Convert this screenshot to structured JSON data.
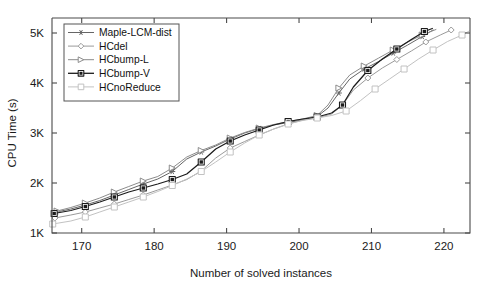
{
  "chart_data": {
    "type": "line",
    "title": "",
    "xlabel": "Number of solved instances",
    "ylabel": "CPU Time (s)",
    "xlim": [
      165.9,
      223.6
    ],
    "ylim": [
      1000,
      5300
    ],
    "xticks": [
      170,
      180,
      190,
      200,
      210,
      220
    ],
    "xticklabels": [
      "170",
      "180",
      "190",
      "200",
      "210",
      "220"
    ],
    "yticks": [
      1000,
      2000,
      3000,
      4000,
      5000
    ],
    "yticklabels": [
      "1K",
      "2K",
      "3K",
      "4K",
      "5K"
    ],
    "grid": false,
    "legend_position": "upper left",
    "series": [
      {
        "name": "Maple-LCM-dist",
        "color": "#666666",
        "marker": "star",
        "x": [
          166.5,
          168.5,
          170.5,
          172.5,
          174.5,
          176.5,
          178.5,
          180.5,
          182.5,
          184.5,
          186.5,
          188.5,
          190.5,
          192.5,
          194.5,
          196.5,
          198.5,
          200.5,
          202.5,
          204.0,
          205.5,
          207.0,
          209.0,
          211.0,
          213.0,
          215.0,
          217.0,
          218.5
        ],
        "y": [
          1420,
          1480,
          1560,
          1650,
          1760,
          1870,
          1980,
          2080,
          2230,
          2480,
          2620,
          2740,
          2880,
          3000,
          3090,
          3160,
          3210,
          3260,
          3330,
          3500,
          3800,
          4080,
          4280,
          4430,
          4600,
          4760,
          4930,
          5060
        ]
      },
      {
        "name": "HCdel",
        "color": "#9a9a9a",
        "marker": "diamond",
        "x": [
          166.3,
          168.5,
          170.5,
          172.5,
          174.5,
          176.5,
          178.5,
          180.5,
          182.5,
          184.5,
          186.5,
          188.5,
          190.5,
          192.5,
          194.5,
          196.5,
          198.5,
          200.5,
          202.5,
          204.5,
          206.0,
          207.5,
          209.5,
          211.5,
          213.5,
          215.5,
          217.5,
          219.5,
          221.0
        ],
        "y": [
          1300,
          1360,
          1420,
          1500,
          1580,
          1670,
          1760,
          1860,
          1960,
          2070,
          2240,
          2500,
          2700,
          2830,
          2960,
          3080,
          3180,
          3260,
          3300,
          3380,
          3560,
          3860,
          4100,
          4300,
          4470,
          4640,
          4820,
          4960,
          5060
        ]
      },
      {
        "name": "HCbump-L",
        "color": "#8c8c8c",
        "marker": "triangle-right",
        "x": [
          166.6,
          168.5,
          170.5,
          172.5,
          174.5,
          176.5,
          178.5,
          180.5,
          182.5,
          184.5,
          186.5,
          188.5,
          190.5,
          192.5,
          194.5,
          196.5,
          198.5,
          200.5,
          202.5,
          204.0,
          205.5,
          207.0,
          209.0,
          211.0,
          213.0,
          215.0,
          217.0,
          218.9
        ],
        "y": [
          1440,
          1510,
          1600,
          1700,
          1820,
          1930,
          2040,
          2130,
          2300,
          2520,
          2650,
          2760,
          2900,
          3010,
          3100,
          3170,
          3230,
          3280,
          3350,
          3560,
          3900,
          4160,
          4340,
          4500,
          4660,
          4820,
          4960,
          5070
        ]
      },
      {
        "name": "HCbump-V",
        "color": "#1b1b1b",
        "marker": "square-filled",
        "x": [
          166.2,
          168.5,
          170.5,
          172.5,
          174.5,
          176.5,
          178.5,
          180.5,
          182.5,
          184.5,
          186.5,
          188.5,
          190.5,
          192.5,
          194.5,
          196.5,
          198.5,
          200.5,
          202.5,
          204.5,
          206.0,
          207.5,
          209.5,
          211.5,
          213.5,
          215.5,
          217.3,
          218.4
        ],
        "y": [
          1390,
          1450,
          1530,
          1620,
          1720,
          1820,
          1900,
          1980,
          2070,
          2180,
          2420,
          2680,
          2840,
          2960,
          3060,
          3160,
          3230,
          3280,
          3320,
          3400,
          3560,
          3920,
          4250,
          4480,
          4680,
          4870,
          5030,
          5090
        ]
      },
      {
        "name": "HCnoReduce",
        "color": "#c2c2c2",
        "marker": "square-open",
        "x": [
          166.0,
          168.5,
          170.5,
          172.5,
          174.5,
          176.5,
          178.5,
          180.5,
          182.5,
          184.5,
          186.5,
          188.5,
          190.5,
          192.5,
          194.5,
          196.5,
          198.5,
          200.5,
          202.5,
          204.5,
          206.5,
          208.5,
          210.5,
          212.5,
          214.5,
          216.5,
          218.5,
          220.5,
          222.5,
          223.5
        ],
        "y": [
          1180,
          1240,
          1320,
          1420,
          1520,
          1620,
          1720,
          1830,
          1950,
          2080,
          2230,
          2420,
          2620,
          2800,
          2960,
          3080,
          3180,
          3250,
          3300,
          3350,
          3440,
          3650,
          3880,
          4080,
          4280,
          4480,
          4660,
          4830,
          4960,
          5040
        ]
      }
    ]
  },
  "legend": {
    "entries": [
      {
        "label": "Maple-LCM-dist"
      },
      {
        "label": "HCdel"
      },
      {
        "label": "HCbump-L"
      },
      {
        "label": "HCbump-V"
      },
      {
        "label": "HCnoReduce"
      }
    ]
  }
}
